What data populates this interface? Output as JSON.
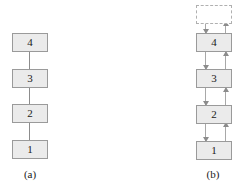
{
  "figure": {
    "width": 245,
    "height": 189,
    "background": "#ffffff",
    "box_fill": "#ebebeb",
    "box_border": "#9a9a9a",
    "ghost_border": "#b0b0b0",
    "connector_color": "#8c8c8c"
  },
  "panel_a": {
    "caption": "(a)",
    "nodes": [
      {
        "label": "4"
      },
      {
        "label": "3"
      },
      {
        "label": "2"
      },
      {
        "label": "1"
      }
    ]
  },
  "panel_b": {
    "caption": "(b)",
    "ghost_node": {
      "label": ""
    },
    "nodes": [
      {
        "label": "4"
      },
      {
        "label": "3"
      },
      {
        "label": "2"
      },
      {
        "label": "1"
      }
    ]
  }
}
